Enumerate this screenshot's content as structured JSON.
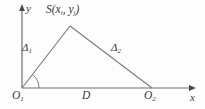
{
  "figure": {
    "type": "geometry-diagram",
    "background_color": "#fdfdfd",
    "stroke_color": "#6f6f6f",
    "text_color": "#3a3a3a"
  },
  "axes": {
    "y_label": "y",
    "x_label": "x",
    "origin_x": 22,
    "origin_y": 88,
    "x_axis_end": 196,
    "y_axis_top": 8
  },
  "labels": {
    "apex": {
      "symbol": "S",
      "open_paren": "(",
      "var_x": "x",
      "sub_x": "i",
      "comma": ", ",
      "var_y": "y",
      "sub_y": "j",
      "close_paren": ")",
      "full": "S(xi, yj)"
    },
    "side_left": {
      "symbol": "Δ",
      "subscript": "1",
      "full": "Δ1"
    },
    "side_right": {
      "symbol": "Δ",
      "subscript": "2",
      "full": "Δ2"
    },
    "base": {
      "symbol": "D",
      "full": "D"
    },
    "origin_left": {
      "symbol": "O",
      "subscript": "1",
      "full": "O1"
    },
    "origin_right": {
      "symbol": "O",
      "subscript": "2",
      "full": "O2"
    }
  },
  "geometry": {
    "vertices": {
      "O1": [
        22,
        88
      ],
      "S": [
        70,
        26
      ],
      "O2": [
        152,
        88
      ]
    },
    "angle_arc": {
      "at": "O1",
      "radius": 17,
      "from_degrees": 0,
      "to_degrees": 52
    }
  }
}
